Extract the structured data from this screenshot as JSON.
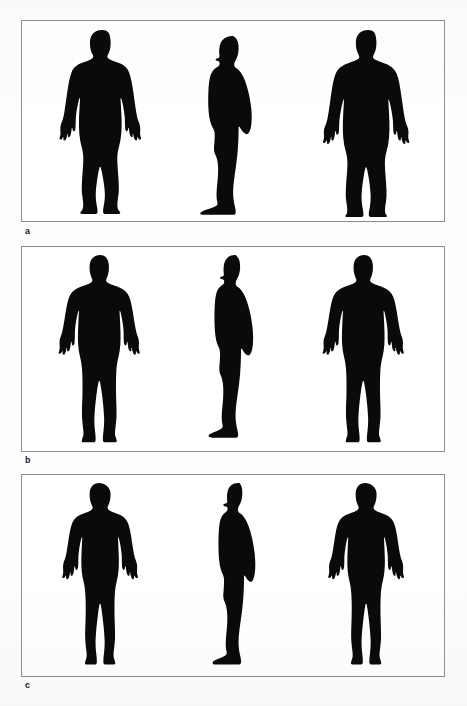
{
  "page": {
    "background_color": "#ffffff",
    "border_color": "#8e8e8e",
    "silhouette_color": "#0a0a0a",
    "width": 467,
    "height": 706
  },
  "panels": [
    {
      "label": "a",
      "caption": "a",
      "body_type": "obese",
      "sex": "female",
      "views": [
        {
          "name": "front",
          "label": "front view"
        },
        {
          "name": "side",
          "label": "side view"
        },
        {
          "name": "rear",
          "label": "rear view"
        }
      ]
    },
    {
      "label": "b",
      "caption": "b",
      "body_type": "average",
      "sex": "male",
      "views": [
        {
          "name": "front",
          "label": "front view"
        },
        {
          "name": "side",
          "label": "side view"
        },
        {
          "name": "rear",
          "label": "rear view"
        }
      ]
    },
    {
      "label": "c",
      "caption": "c",
      "body_type": "slender",
      "sex": "female",
      "views": [
        {
          "name": "front",
          "label": "front view"
        },
        {
          "name": "side",
          "label": "side view"
        },
        {
          "name": "rear",
          "label": "rear view"
        }
      ]
    }
  ]
}
